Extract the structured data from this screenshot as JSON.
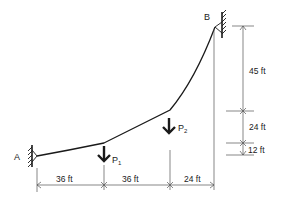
{
  "diagram": {
    "type": "cable-structure",
    "supports": {
      "A": {
        "label": "A"
      },
      "B": {
        "label": "B"
      }
    },
    "loads": [
      {
        "id": "P1",
        "label": "P",
        "subscript": "1"
      },
      {
        "id": "P2",
        "label": "P",
        "subscript": "2"
      }
    ],
    "horizontal_dimensions": [
      {
        "label": "36 ft"
      },
      {
        "label": "36 ft"
      },
      {
        "label": "24 ft"
      }
    ],
    "vertical_dimensions": [
      {
        "label": "45 ft"
      },
      {
        "label": "24 ft"
      },
      {
        "label": "12 ft"
      }
    ],
    "colors": {
      "line": "#1a1a1a",
      "dimension": "#555555",
      "background": "#ffffff"
    }
  }
}
